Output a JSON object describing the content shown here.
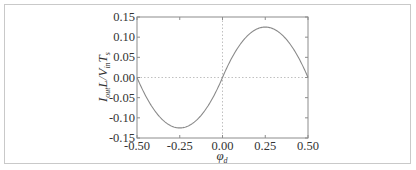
{
  "chart_data": {
    "type": "line",
    "title": "",
    "xlabel": "φd",
    "ylabel": "Iout L / Vin Ts",
    "xlim": [
      -0.5,
      0.5
    ],
    "ylim": [
      -0.15,
      0.15
    ],
    "x_ticks": [
      "-0.50",
      "-0.25",
      "0.00",
      "0.25",
      "0.50"
    ],
    "y_ticks": [
      "0.15",
      "0.10",
      "0.05",
      "0.00",
      "-0.05",
      "-0.10",
      "-0.15"
    ],
    "grid": false,
    "reference_lines": {
      "y_zero": true,
      "x_zero": true,
      "style": "dotted"
    },
    "legend": null,
    "series": [
      {
        "name": "Iout L / Vin Ts",
        "color": "#8a8a8a",
        "x": [
          -0.5,
          -0.45,
          -0.4,
          -0.35,
          -0.3,
          -0.25,
          -0.2,
          -0.15,
          -0.1,
          -0.05,
          0.0,
          0.05,
          0.1,
          0.15,
          0.2,
          0.25,
          0.3,
          0.35,
          0.4,
          0.45,
          0.5
        ],
        "values": [
          0.0,
          -0.045,
          -0.08,
          -0.105,
          -0.12,
          -0.125,
          -0.12,
          -0.105,
          -0.08,
          -0.045,
          0.0,
          0.045,
          0.08,
          0.105,
          0.12,
          0.125,
          0.12,
          0.105,
          0.08,
          0.045,
          0.0
        ]
      }
    ]
  },
  "labels": {
    "ylabel_main": "I",
    "ylabel_sub1": "out",
    "ylabel_mid": "L/V",
    "ylabel_sub2": "in",
    "ylabel_T": "T",
    "ylabel_sub3": "s",
    "xlabel_main": "φ",
    "xlabel_sub": "d"
  }
}
